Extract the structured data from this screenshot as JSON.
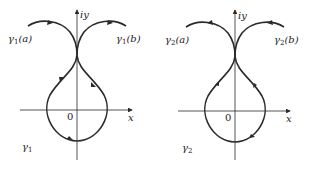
{
  "panels": [
    {
      "id": "gamma1",
      "curve_name": "γ",
      "curve_sub": "1",
      "start_label": "γ1(a)",
      "start_label_parts": {
        "sym": "γ",
        "sub": "1",
        "arg": "(a)"
      },
      "end_label_parts": {
        "sym": "γ",
        "sub": "1",
        "arg": "(b)"
      },
      "end_label": "γ1(b)",
      "y_axis_label": "iy",
      "x_axis_label": "x",
      "origin_label": "0",
      "orientation": "counterclockwise loop"
    },
    {
      "id": "gamma2",
      "curve_name": "γ",
      "curve_sub": "2",
      "start_label": "γ2(a)",
      "start_label_parts": {
        "sym": "γ",
        "sub": "2",
        "arg": "(a)"
      },
      "end_label_parts": {
        "sym": "γ",
        "sub": "2",
        "arg": "(b)"
      },
      "end_label": "γ2(b)",
      "y_axis_label": "iy",
      "x_axis_label": "x",
      "origin_label": "0",
      "orientation": "clockwise loop"
    }
  ],
  "colors": {
    "stroke": "#2a2a2a",
    "background": "#ffffff"
  }
}
